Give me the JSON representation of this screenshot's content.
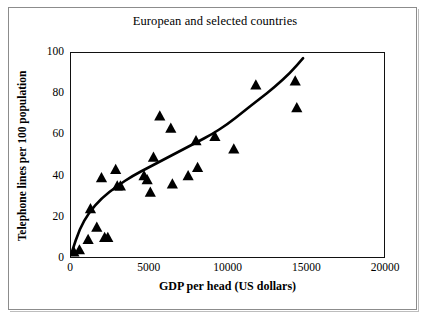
{
  "chart_data": {
    "type": "scatter",
    "title": "European and selected countries",
    "xlabel": "GDP per head (US dollars)",
    "ylabel": "Telephone lines per 100 population",
    "xlim": [
      0,
      20000
    ],
    "ylim": [
      0,
      100
    ],
    "xticks": [
      0,
      5000,
      10000,
      15000,
      20000
    ],
    "yticks": [
      0,
      20,
      40,
      60,
      80,
      100
    ],
    "xtick_labels": [
      "0",
      "5000",
      "10000",
      "15000",
      "20000"
    ],
    "ytick_labels": [
      "0",
      "20",
      "40",
      "60",
      "80",
      "100"
    ],
    "grid": false,
    "legend": "none",
    "marker": "triangle",
    "marker_color": "#000000",
    "line_color": "#000000",
    "series": [
      {
        "name": "Countries",
        "points": [
          [
            250,
            3
          ],
          [
            600,
            4
          ],
          [
            1150,
            9
          ],
          [
            1300,
            24
          ],
          [
            1700,
            15
          ],
          [
            2000,
            39
          ],
          [
            2200,
            10
          ],
          [
            2400,
            10
          ],
          [
            2900,
            43
          ],
          [
            3000,
            35
          ],
          [
            3200,
            35
          ],
          [
            4700,
            40
          ],
          [
            4900,
            38
          ],
          [
            5100,
            32
          ],
          [
            5300,
            49
          ],
          [
            5700,
            69
          ],
          [
            6400,
            63
          ],
          [
            6500,
            36
          ],
          [
            7500,
            40
          ],
          [
            8000,
            57
          ],
          [
            8100,
            44
          ],
          [
            9200,
            59
          ],
          [
            10400,
            53
          ],
          [
            11800,
            84
          ],
          [
            14300,
            86
          ],
          [
            14400,
            73
          ]
        ]
      }
    ],
    "trend_line": {
      "name": "Fitted curve",
      "points": [
        [
          120,
          3
        ],
        [
          600,
          14
        ],
        [
          1200,
          22
        ],
        [
          2000,
          29
        ],
        [
          3000,
          35
        ],
        [
          4000,
          40
        ],
        [
          5000,
          44
        ],
        [
          6000,
          48
        ],
        [
          7000,
          52
        ],
        [
          8000,
          56
        ],
        [
          9000,
          60
        ],
        [
          10000,
          65
        ],
        [
          11000,
          71
        ],
        [
          12000,
          77
        ],
        [
          13000,
          83
        ],
        [
          14000,
          90
        ],
        [
          14800,
          97
        ]
      ]
    }
  }
}
